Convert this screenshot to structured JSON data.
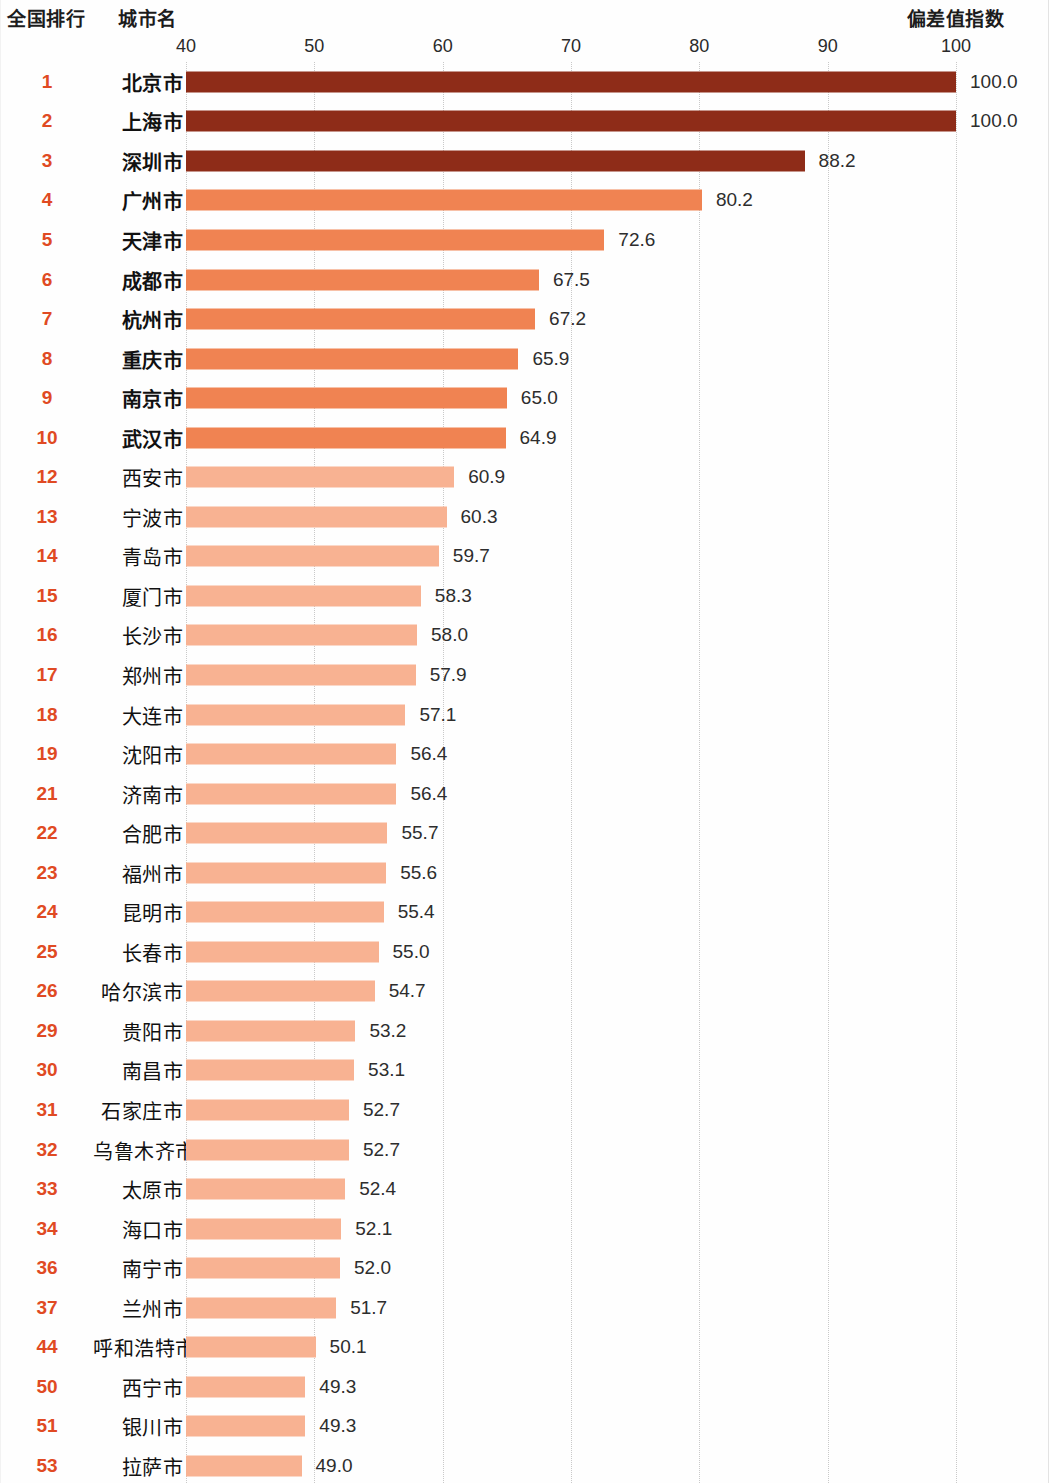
{
  "header": {
    "rank_label": "全国排行",
    "city_label": "城市名",
    "index_label": "偏差值指数"
  },
  "chart_data": {
    "type": "bar",
    "orientation": "horizontal",
    "title": "",
    "xlabel": "偏差值指数",
    "ylabel": "城市名",
    "xlim": [
      40,
      100
    ],
    "xticks": [
      40,
      50,
      60,
      70,
      80,
      90,
      100
    ],
    "grid": true,
    "legend": "none",
    "colors": {
      "tier_dark": "#8e2c18",
      "tier_mid": "#f08352",
      "tier_light": "#f8b292",
      "rank_text": "#e04a23",
      "gridline": "#c9c9c9"
    },
    "categories": [
      "北京市",
      "上海市",
      "深圳市",
      "广州市",
      "天津市",
      "成都市",
      "杭州市",
      "重庆市",
      "南京市",
      "武汉市",
      "西安市",
      "宁波市",
      "青岛市",
      "厦门市",
      "长沙市",
      "郑州市",
      "大连市",
      "沈阳市",
      "济南市",
      "合肥市",
      "福州市",
      "昆明市",
      "长春市",
      "哈尔滨市",
      "贵阳市",
      "南昌市",
      "石家庄市",
      "乌鲁木齐市",
      "太原市",
      "海口市",
      "南宁市",
      "兰州市",
      "呼和浩特市",
      "西宁市",
      "银川市",
      "拉萨市"
    ],
    "values": [
      100.0,
      100.0,
      88.2,
      80.2,
      72.6,
      67.5,
      67.2,
      65.9,
      65.0,
      64.9,
      60.9,
      60.3,
      59.7,
      58.3,
      58.0,
      57.9,
      57.1,
      56.4,
      56.4,
      55.7,
      55.6,
      55.4,
      55.0,
      54.7,
      53.2,
      53.1,
      52.7,
      52.7,
      52.4,
      52.1,
      52.0,
      51.7,
      50.1,
      49.3,
      49.3,
      49.0
    ],
    "ranks": [
      "1",
      "2",
      "3",
      "4",
      "5",
      "6",
      "7",
      "8",
      "9",
      "10",
      "12",
      "13",
      "14",
      "15",
      "16",
      "17",
      "18",
      "19",
      "21",
      "22",
      "23",
      "24",
      "25",
      "26",
      "29",
      "30",
      "31",
      "32",
      "33",
      "34",
      "36",
      "37",
      "44",
      "50",
      "51",
      "53"
    ],
    "value_labels": [
      "100.0",
      "100.0",
      "88.2",
      "80.2",
      "72.6",
      "67.5",
      "67.2",
      "65.9",
      "65.0",
      "64.9",
      "60.9",
      "60.3",
      "59.7",
      "58.3",
      "58.0",
      "57.9",
      "57.1",
      "56.4",
      "56.4",
      "55.7",
      "55.6",
      "55.4",
      "55.0",
      "54.7",
      "53.2",
      "53.1",
      "52.7",
      "52.7",
      "52.4",
      "52.1",
      "52.0",
      "51.7",
      "50.1",
      "49.3",
      "49.3",
      "49.0"
    ],
    "tiers": [
      "dark",
      "dark",
      "dark",
      "mid",
      "mid",
      "mid",
      "mid",
      "mid",
      "mid",
      "mid",
      "light",
      "light",
      "light",
      "light",
      "light",
      "light",
      "light",
      "light",
      "light",
      "light",
      "light",
      "light",
      "light",
      "light",
      "light",
      "light",
      "light",
      "light",
      "light",
      "light",
      "light",
      "light",
      "light",
      "light",
      "light",
      "light"
    ],
    "bold_rows": [
      true,
      true,
      true,
      true,
      true,
      true,
      true,
      true,
      true,
      true,
      false,
      false,
      false,
      false,
      false,
      false,
      false,
      false,
      false,
      false,
      false,
      false,
      false,
      false,
      false,
      false,
      false,
      false,
      false,
      false,
      false,
      false,
      false,
      false,
      false,
      false
    ]
  }
}
